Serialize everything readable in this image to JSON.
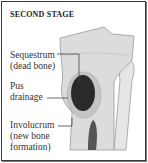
{
  "figure": {
    "title": "SECOND STAGE",
    "labels": {
      "sequestrum_line1": "Sequestrum",
      "sequestrum_line2": "(dead bone)",
      "pus_line1": "Pus",
      "pus_line2": "drainage",
      "involucrum_line1": "Involucrum",
      "involucrum_line2": "(new bone",
      "involucrum_line3": "formation)"
    },
    "colors": {
      "frame": "#3a3a3a",
      "bone": "#dcdcdc",
      "bone_edge": "#9a9a9a",
      "sequestrum": "#2a2a2a",
      "marrow": "#555555"
    }
  }
}
